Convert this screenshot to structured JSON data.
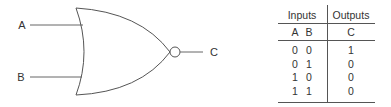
{
  "gate": {
    "type": "NOR",
    "inputs": [
      "A",
      "B"
    ],
    "output": "C",
    "stroke_color": "#555555"
  },
  "truth_table": {
    "group_headers": [
      "Inputs",
      "Outputs"
    ],
    "column_headers": [
      "A",
      "B",
      "C"
    ],
    "rows": [
      {
        "A": "0",
        "B": "0",
        "C": "1"
      },
      {
        "A": "0",
        "B": "1",
        "C": "0"
      },
      {
        "A": "1",
        "B": "0",
        "C": "0"
      },
      {
        "A": "1",
        "B": "1",
        "C": "0"
      }
    ]
  }
}
